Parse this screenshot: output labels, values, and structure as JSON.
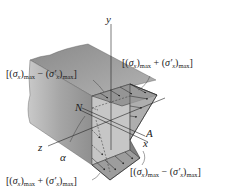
{
  "diagram": {
    "type": "3d-beam-stress-distribution",
    "axes": {
      "y": "y",
      "z": "z",
      "x": "x"
    },
    "points": {
      "neutral_axis": "N",
      "point_A": "A",
      "angle": "α"
    },
    "labels": {
      "top_left": {
        "open": "[(",
        "sigma": "σ",
        "sub1": "x",
        "close1": ")",
        "max1": "max",
        "op": " − (",
        "sigma2": "σ′",
        "sub2": "x",
        "close2": ")",
        "max2": "max",
        "end": "]"
      },
      "top_right": {
        "open": "[(",
        "sigma": "σ",
        "sub1": "x",
        "close1": ")",
        "max1": "max",
        "op": " + (",
        "sigma2": "σ′",
        "sub2": "x",
        "close2": ")",
        "max2": "max",
        "end": "]"
      },
      "bottom_left": {
        "open": "[(",
        "sigma": "σ",
        "sub1": "x",
        "close1": ")",
        "max1": "max",
        "op": " + (",
        "sigma2": "σ′",
        "sub2": "x",
        "close2": ")",
        "max2": "max",
        "end": "]"
      },
      "bottom_right": {
        "open": "[(",
        "sigma": "σ",
        "sub1": "x",
        "close1": ")",
        "max1": "max",
        "op": " − (",
        "sigma2": "σ′",
        "sub2": "x",
        "close2": ")",
        "max2": "max",
        "end": "]"
      }
    },
    "colors": {
      "beam_face": "#9a9a9a",
      "beam_top": "#b8b8b8",
      "section": "#c4c4c4",
      "stress_fill": "#8c8c8c",
      "lines": "#222222"
    }
  }
}
